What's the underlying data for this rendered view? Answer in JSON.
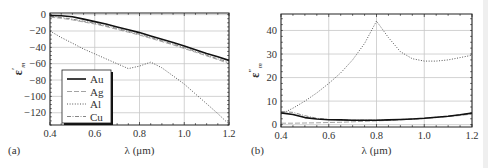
{
  "chart_data": [
    {
      "panel_label": "(a)",
      "type": "line",
      "title": "",
      "xlabel": "λ (μm)",
      "ylabel": "ε′m",
      "ylabel_main": "ε",
      "ylabel_sup": "′",
      "ylabel_sub": "m",
      "xlim": [
        0.4,
        1.2
      ],
      "ylim": [
        -135,
        2
      ],
      "xticks": [
        0.4,
        0.6,
        0.8,
        1.0,
        1.2
      ],
      "xtick_labels": [
        "0.4",
        "0.6",
        "0.8",
        "1.0",
        "1.2"
      ],
      "yticks": [
        0,
        -20,
        -40,
        -60,
        -80,
        -100,
        -120
      ],
      "ytick_labels": [
        "0",
        "−20",
        "−40",
        "−60",
        "−80",
        "−100",
        "−120"
      ],
      "grid": true,
      "legend_position": "lower left (inside)",
      "legend": [
        "Au",
        "Ag",
        "Al",
        "Cu"
      ],
      "x": [
        0.4,
        0.45,
        0.5,
        0.55,
        0.6,
        0.65,
        0.7,
        0.75,
        0.8,
        0.85,
        0.9,
        0.95,
        1.0,
        1.05,
        1.1,
        1.15,
        1.2
      ],
      "series": [
        {
          "name": "Au",
          "style": "solid",
          "values": [
            -1.0,
            -1.3,
            -2.5,
            -5.5,
            -8.5,
            -11.5,
            -15,
            -18.5,
            -22,
            -26,
            -30,
            -34,
            -38.5,
            -43,
            -47.5,
            -51.5,
            -56
          ]
        },
        {
          "name": "Ag",
          "style": "dashed",
          "values": [
            -3.0,
            -4.5,
            -6.5,
            -9,
            -11.5,
            -14.5,
            -18,
            -21.5,
            -25,
            -29,
            -33,
            -37,
            -41.5,
            -46,
            -50.5,
            -55,
            -60
          ]
        },
        {
          "name": "Al",
          "style": "dotted",
          "values": [
            -20,
            -28,
            -35,
            -42,
            -48,
            -54,
            -60,
            -66,
            -63,
            -58,
            -65,
            -75,
            -85,
            -97,
            -109,
            -121,
            -134
          ]
        },
        {
          "name": "Cu",
          "style": "dash-dot",
          "values": [
            -2.0,
            -3.5,
            -5.5,
            -8,
            -10.5,
            -13.5,
            -17,
            -20.5,
            -24,
            -28,
            -32,
            -36,
            -40.5,
            -45,
            -49.5,
            -54,
            -58
          ]
        }
      ]
    },
    {
      "panel_label": "(b)",
      "type": "line",
      "title": "",
      "xlabel": "λ (μm)",
      "ylabel": "ε″m",
      "ylabel_main": "ε",
      "ylabel_sup": "″",
      "ylabel_sub": "m",
      "xlim": [
        0.4,
        1.2
      ],
      "ylim": [
        -1,
        47
      ],
      "xticks": [
        0.4,
        0.6,
        0.8,
        1.0,
        1.2
      ],
      "xtick_labels": [
        "0.4",
        "0.6",
        "0.8",
        "1.0",
        "1.2"
      ],
      "yticks": [
        0,
        10,
        20,
        30,
        40
      ],
      "ytick_labels": [
        "0",
        "10",
        "20",
        "30",
        "40"
      ],
      "grid": true,
      "legend": [],
      "x": [
        0.4,
        0.45,
        0.5,
        0.55,
        0.6,
        0.65,
        0.7,
        0.75,
        0.8,
        0.85,
        0.9,
        0.95,
        1.0,
        1.05,
        1.1,
        1.15,
        1.2
      ],
      "series": [
        {
          "name": "Au",
          "style": "solid",
          "values": [
            5.0,
            4.3,
            3.0,
            2.4,
            2.1,
            2.0,
            1.9,
            1.9,
            1.9,
            2.0,
            2.2,
            2.4,
            2.7,
            3.1,
            3.6,
            4.2,
            4.9
          ]
        },
        {
          "name": "Ag",
          "style": "dashed",
          "values": [
            0.6,
            0.6,
            0.7,
            0.8,
            0.9,
            1.0,
            1.2,
            1.4,
            1.6,
            1.8,
            2.0,
            2.3,
            2.6,
            3.0,
            3.4,
            3.9,
            4.5
          ]
        },
        {
          "name": "Al",
          "style": "dotted",
          "values": [
            4.5,
            7,
            10,
            13.5,
            17.5,
            22,
            27.5,
            34.5,
            44,
            37,
            31,
            28,
            27,
            27,
            27.5,
            28.5,
            29.5
          ]
        },
        {
          "name": "Cu",
          "style": "dash-dot",
          "values": [
            5.6,
            5.2,
            3.8,
            2.7,
            2.2,
            2.0,
            1.9,
            1.9,
            1.9,
            2.0,
            2.2,
            2.4,
            2.7,
            3.1,
            3.6,
            4.2,
            4.9
          ]
        }
      ]
    }
  ]
}
